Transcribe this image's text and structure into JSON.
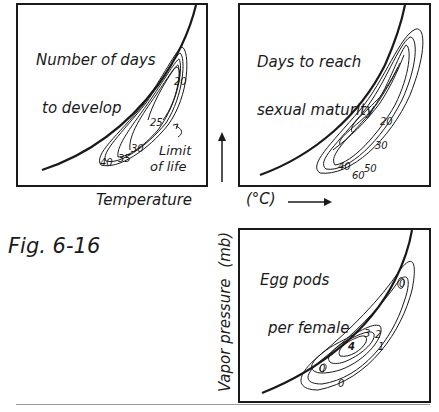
{
  "figure": {
    "label": "Fig. 6-16"
  },
  "axes": {
    "x_label": "Temperature",
    "x_unit": "(°C)",
    "y_label": "Vapor pressure",
    "y_unit": "(mb)"
  },
  "panels": [
    {
      "id": "development",
      "title_line1": "Number of days",
      "title_line2": "to develop",
      "contour_labels": [
        "20",
        "25",
        "30",
        "35",
        "40"
      ],
      "annotation_line1": "Limit",
      "annotation_line2": "of life"
    },
    {
      "id": "maturity",
      "title_line1": "Days to reach",
      "title_line2": "sexual maturity",
      "contour_labels": [
        "20",
        "30",
        "40",
        "50",
        "60"
      ]
    },
    {
      "id": "eggs",
      "title_line1": "Egg pods",
      "title_line2": "per female",
      "contour_labels": [
        "0",
        "0",
        "0",
        "1",
        "2",
        "3",
        "4"
      ]
    }
  ],
  "colors": {
    "ink": "#1a1a1a",
    "paper": "#ffffff",
    "rule": "#999999"
  }
}
